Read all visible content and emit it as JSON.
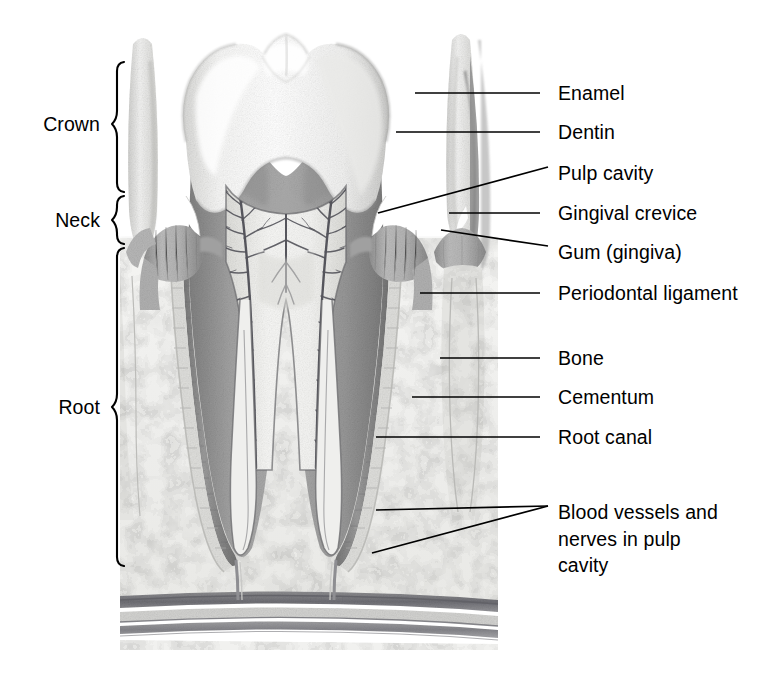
{
  "figure": {
    "kind": "anatomical-illustration",
    "style": "grayscale pencil / airbrush medical illustration",
    "background_color": "#ffffff",
    "ink_color": "#000000"
  },
  "section_brackets": [
    {
      "name": "crown",
      "label": "Crown",
      "top": 62,
      "bottom": 192,
      "text_y": 124
    },
    {
      "name": "neck",
      "label": "Neck",
      "top": 196,
      "bottom": 244,
      "text_y": 220
    },
    {
      "name": "root",
      "label": "Root",
      "top": 248,
      "bottom": 566,
      "text_y": 407
    }
  ],
  "callouts": [
    {
      "name": "enamel",
      "label": "Enamel",
      "text_y": 93,
      "lines": [
        [
          540,
          93,
          415,
          93
        ]
      ]
    },
    {
      "name": "dentin",
      "label": "Dentin",
      "text_y": 132,
      "lines": [
        [
          540,
          132,
          396,
          132
        ]
      ]
    },
    {
      "name": "pulp-cavity",
      "label": "Pulp cavity",
      "text_y": 173,
      "lines": [
        [
          548,
          167,
          378,
          213
        ]
      ]
    },
    {
      "name": "gingival-crevice",
      "label": "Gingival crevice",
      "text_y": 213,
      "lines": [
        [
          540,
          213,
          449,
          213
        ]
      ]
    },
    {
      "name": "gum-gingiva",
      "label": "Gum (gingiva)",
      "text_y": 252,
      "lines": [
        [
          548,
          246,
          441,
          230
        ]
      ]
    },
    {
      "name": "periodontal-ligament",
      "label": "Periodontal ligament",
      "text_y": 293,
      "lines": [
        [
          540,
          293,
          420,
          293
        ]
      ]
    },
    {
      "name": "bone",
      "label": "Bone",
      "text_y": 358,
      "lines": [
        [
          540,
          358,
          440,
          358
        ]
      ]
    },
    {
      "name": "cementum",
      "label": "Cementum",
      "text_y": 397,
      "lines": [
        [
          540,
          397,
          412,
          397
        ]
      ]
    },
    {
      "name": "root-canal",
      "label": "Root canal",
      "text_y": 437,
      "lines": [
        [
          540,
          437,
          376,
          437
        ]
      ]
    },
    {
      "name": "blood-vessels-nerves",
      "label": "Blood vessels and\nnerves in pulp\ncavity",
      "text_y": 512,
      "lines": [
        [
          548,
          506,
          376,
          510
        ],
        [
          548,
          506,
          372,
          553
        ]
      ]
    }
  ],
  "anatomy_regions": [
    {
      "name": "enamel",
      "tone": "#fbfbfb",
      "description": "outer white cap of the crown"
    },
    {
      "name": "dentin",
      "tone": "#9a9a9a",
      "description": "mid-gray bulk beneath enamel"
    },
    {
      "name": "pulp-cavity",
      "tone": "#f2f2f0",
      "description": "pale chamber with branching vessels"
    },
    {
      "name": "pulp-vessels",
      "tone": "#5c5c62",
      "description": "dark branching blood vessels and nerves"
    },
    {
      "name": "root-canal",
      "tone": "#efefed",
      "description": "narrow pale channel inside each root"
    },
    {
      "name": "cementum",
      "tone": "#8e8e90",
      "description": "thin striated layer over root dentin"
    },
    {
      "name": "periodontal-ligament",
      "tone": "#d8d8d6",
      "description": "pale striated band around root"
    },
    {
      "name": "bone",
      "tone": "#f0f0ee",
      "description": "speckled alveolar bone"
    },
    {
      "name": "gum-gingiva",
      "tone": "#b3b3b3",
      "description": "striated gum cuff at the neck"
    },
    {
      "name": "gingival-crevice",
      "tone": "#ffffff",
      "description": "white triangular gap between gum and enamel"
    },
    {
      "name": "neighbor-tooth",
      "tone": "#e6e6e4",
      "description": "adjacent teeth at left and right edges"
    },
    {
      "name": "nerve-bundle",
      "tone": "#7e7e82",
      "description": "horizontal nerve and vessel bands below roots"
    }
  ]
}
